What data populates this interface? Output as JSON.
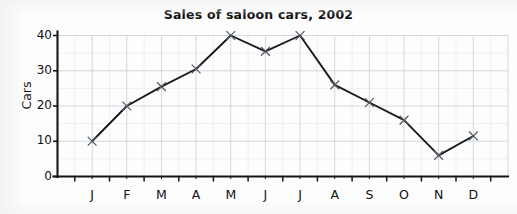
{
  "chart_data": {
    "type": "line",
    "title": "Sales of saloon cars, 2002",
    "xlabel": "",
    "ylabel": "Cars",
    "categories": [
      "J",
      "F",
      "M",
      "A",
      "M",
      "J",
      "J",
      "A",
      "S",
      "O",
      "N",
      "D"
    ],
    "category_names": [
      "January",
      "February",
      "March",
      "April",
      "May",
      "June",
      "July",
      "August",
      "September",
      "October",
      "November",
      "December"
    ],
    "values": [
      10,
      20,
      25.5,
      30.5,
      40,
      35.5,
      40,
      26,
      21,
      16,
      6,
      11.5
    ],
    "series": [
      {
        "name": "Cars",
        "values": [
          10,
          20,
          25.5,
          30.5,
          40,
          35.5,
          40,
          26,
          21,
          16,
          6,
          11.5
        ]
      }
    ],
    "ylim": [
      0,
      43
    ],
    "yticks": [
      0,
      10,
      20,
      30,
      40
    ],
    "ytick_labels": [
      "0",
      "10",
      "20",
      "30",
      "40"
    ],
    "xlim": [
      0,
      13
    ],
    "grid": true,
    "legend": false,
    "marker": "x",
    "line_color": "#1a1a1a",
    "grid_color": "#c9d2dc",
    "axis_color": "#141414",
    "background_color": "#fdfdfd"
  },
  "axis": {
    "y_title": "Cars",
    "y_ticks": [
      "0",
      "10",
      "20",
      "30",
      "40"
    ],
    "x_ticks": [
      "J",
      "F",
      "M",
      "A",
      "M",
      "J",
      "J",
      "A",
      "S",
      "O",
      "N",
      "D"
    ]
  },
  "title": {
    "text": "Sales of saloon cars, 2002"
  }
}
